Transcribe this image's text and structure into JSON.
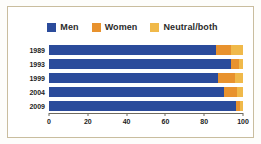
{
  "chart_data": {
    "type": "bar",
    "orientation": "horizontal",
    "stacked": true,
    "title": "",
    "subtitle": "",
    "xlabel": "",
    "ylabel": "",
    "xlim": [
      0,
      100
    ],
    "xticks": [
      0,
      20,
      40,
      60,
      80,
      100
    ],
    "xtick_labels": [
      "0",
      "20",
      "40",
      "60",
      "80",
      "100"
    ],
    "grid": false,
    "legend_position": "top-center",
    "categories": [
      "1989",
      "1993",
      "1999",
      "2004",
      "2009"
    ],
    "series": [
      {
        "name": "Men",
        "color": "#2b4b9b",
        "values": [
          86,
          94,
          87,
          90,
          96.5
        ]
      },
      {
        "name": "Women",
        "color": "#e8922e",
        "values": [
          8,
          4,
          9,
          7,
          2
        ]
      },
      {
        "name": "Neutral/both",
        "color": "#f0b94a",
        "values": [
          6,
          2,
          4,
          3,
          1.5
        ]
      }
    ]
  },
  "legend": {
    "items": [
      {
        "label": "Men",
        "color": "#2b4b9b",
        "swatch_name": "legend-swatch-men"
      },
      {
        "label": "Women",
        "color": "#e8922e",
        "swatch_name": "legend-swatch-women"
      },
      {
        "label": "Neutral/both",
        "color": "#f0b94a",
        "swatch_name": "legend-swatch-neutral"
      }
    ]
  },
  "colors": {
    "men": "#2b4b9b",
    "women": "#e8922e",
    "neutral": "#f0b94a",
    "frame_border": "#c9bd9e",
    "axis": "#6e6a5e",
    "text": "#1c1c1c",
    "background": "#ffffff"
  }
}
